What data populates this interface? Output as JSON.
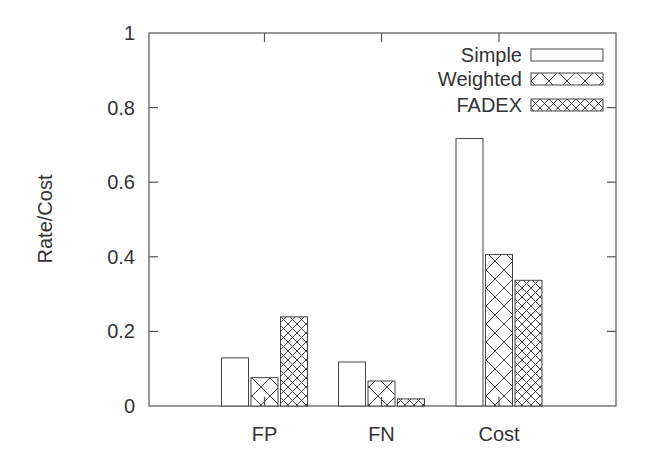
{
  "chart_data": {
    "type": "bar",
    "title": "",
    "xlabel": "",
    "ylabel": "Rate/Cost",
    "ylim": [
      0,
      1
    ],
    "yticks": [
      0,
      0.2,
      0.4,
      0.6,
      0.8,
      1
    ],
    "ytick_labels": [
      "0",
      "0.2",
      "0.4",
      "0.6",
      "0.8",
      "1"
    ],
    "categories": [
      "FP",
      "FN",
      "Cost"
    ],
    "series": [
      {
        "name": "Simple",
        "pattern": "none",
        "values": [
          0.129,
          0.118,
          0.717
        ]
      },
      {
        "name": "Weighted",
        "pattern": "wide-crosshatch",
        "values": [
          0.076,
          0.067,
          0.406
        ]
      },
      {
        "name": "FADEX",
        "pattern": "dense-crosshatch",
        "values": [
          0.239,
          0.019,
          0.337
        ]
      }
    ],
    "grid": false,
    "legend_position": "upper right",
    "colors": {
      "axis": "#555555",
      "bar_stroke": "#444444",
      "bar_fill": "#ffffff",
      "text": "#333333"
    }
  }
}
